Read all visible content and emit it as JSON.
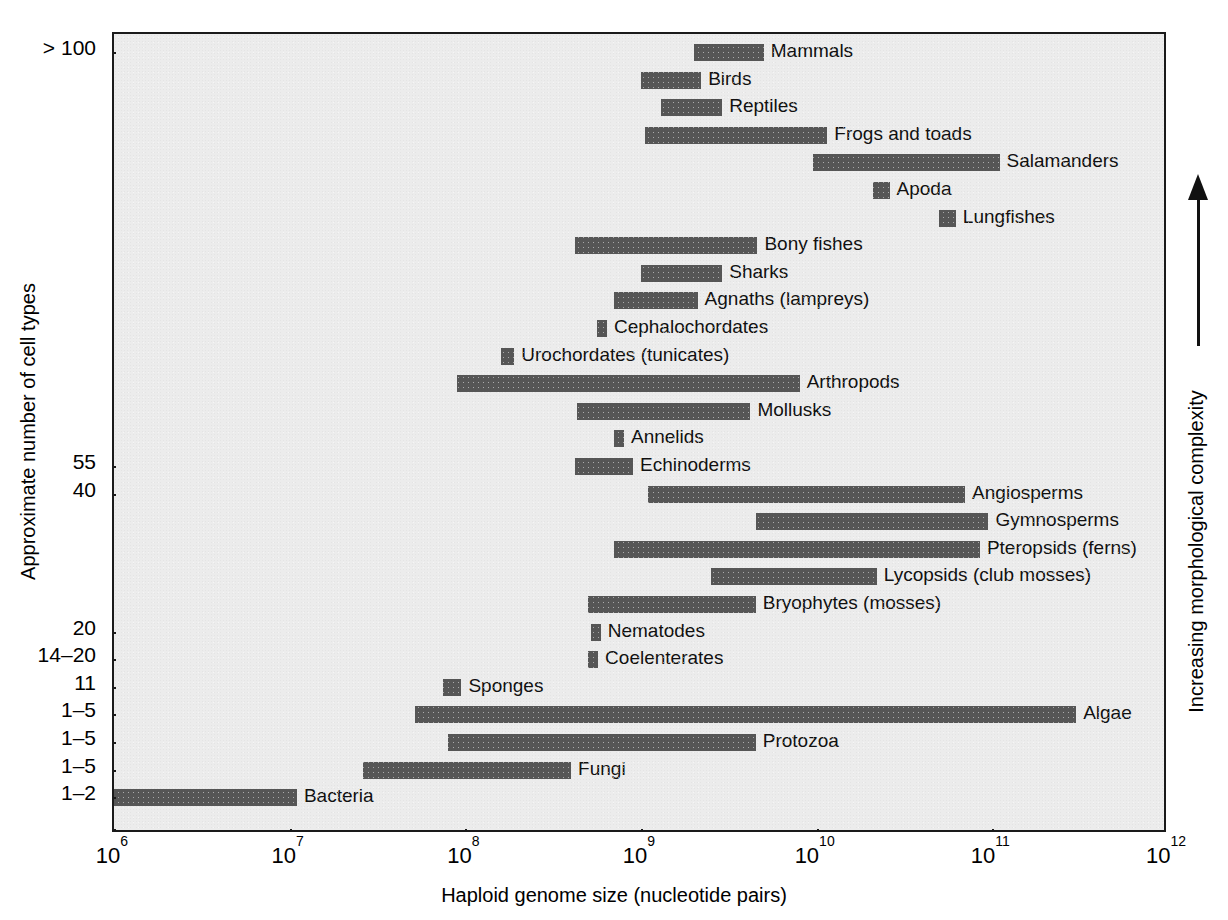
{
  "chart_data": {
    "type": "bar",
    "title": "",
    "xlabel": "Haploid genome size (nucleotide pairs)",
    "ylabel": "Approximate number of cell types",
    "right_axis_label": "Increasing morphological complexity",
    "xscale": "log",
    "xlim": [
      1000000,
      1000000000000
    ],
    "xticks": [
      "10⁶",
      "10⁷",
      "10⁸",
      "10⁹",
      "10¹⁰",
      "10¹¹",
      "10¹²"
    ],
    "xtick_mantissa": [
      "10",
      "10",
      "10",
      "10",
      "10",
      "10",
      "10"
    ],
    "xtick_exponent": [
      "6",
      "7",
      "8",
      "9",
      "10",
      "11",
      "12"
    ],
    "grid": false,
    "legend": "none",
    "bar_color": "#565656",
    "plot_background": "#ececec",
    "frame_color": "#1a1a1a",
    "ytick_labels": [
      {
        "label": "> 100",
        "row": 0
      },
      {
        "label": "55",
        "row": 15
      },
      {
        "label": "40",
        "row": 16
      },
      {
        "label": "20",
        "row": 21
      },
      {
        "label": "14–20",
        "row": 22
      },
      {
        "label": "11",
        "row": 23
      },
      {
        "label": "1–5",
        "row": 24
      },
      {
        "label": "1–5",
        "row": 25
      },
      {
        "label": "1–5",
        "row": 26
      },
      {
        "label": "1–2",
        "row": 27
      }
    ],
    "categories": [
      "Mammals",
      "Birds",
      "Reptiles",
      "Frogs and toads",
      "Salamanders",
      "Apoda",
      "Lungfishes",
      "Bony fishes",
      "Sharks",
      "Agnaths (lampreys)",
      "Cephalochordates",
      "Urochordates (tunicates)",
      "Arthropods",
      "Mollusks",
      "Annelids",
      "Echinoderms",
      "Angiosperms",
      "Gymnosperms",
      "Pteropsids (ferns)",
      "Lycopsids (club mosses)",
      "Bryophytes (mosses)",
      "Nematodes",
      "Coelenterates",
      "Sponges",
      "Algae",
      "Protozoa",
      "Fungi",
      "Bacteria"
    ],
    "ranges": [
      {
        "name": "Mammals",
        "min": 2000000000.0,
        "max": 5000000000.0,
        "label_side": "right"
      },
      {
        "name": "Birds",
        "min": 1000000000.0,
        "max": 2200000000.0,
        "label_side": "right"
      },
      {
        "name": "Reptiles",
        "min": 1300000000.0,
        "max": 2900000000.0,
        "label_side": "right"
      },
      {
        "name": "Frogs and toads",
        "min": 1050000000.0,
        "max": 11500000000.0,
        "label_side": "right"
      },
      {
        "name": "Salamanders",
        "min": 9500000000.0,
        "max": 110000000000.0,
        "label_side": "right"
      },
      {
        "name": "Apoda",
        "min": 21000000000.0,
        "max": 26000000000.0,
        "label_side": "right"
      },
      {
        "name": "Lungfishes",
        "min": 50000000000.0,
        "max": 62000000000.0,
        "label_side": "right"
      },
      {
        "name": "Bony fishes",
        "min": 420000000.0,
        "max": 4600000000.0,
        "label_side": "right"
      },
      {
        "name": "Sharks",
        "min": 1000000000.0,
        "max": 2900000000.0,
        "label_side": "right"
      },
      {
        "name": "Agnaths (lampreys)",
        "min": 700000000.0,
        "max": 2100000000.0,
        "label_side": "right"
      },
      {
        "name": "Cephalochordates",
        "min": 560000000.0,
        "max": 640000000.0,
        "label_side": "right"
      },
      {
        "name": "Urochordates (tunicates)",
        "min": 160000000.0,
        "max": 190000000.0,
        "label_side": "right"
      },
      {
        "name": "Arthropods",
        "min": 90000000.0,
        "max": 8000000000.0,
        "label_side": "right"
      },
      {
        "name": "Mollusks",
        "min": 430000000.0,
        "max": 4200000000.0,
        "label_side": "right"
      },
      {
        "name": "Annelids",
        "min": 700000000.0,
        "max": 800000000.0,
        "label_side": "right"
      },
      {
        "name": "Echinoderms",
        "min": 420000000.0,
        "max": 900000000.0,
        "label_side": "right"
      },
      {
        "name": "Angiosperms",
        "min": 1100000000.0,
        "max": 70000000000.0,
        "label_side": "right"
      },
      {
        "name": "Gymnosperms",
        "min": 4500000000.0,
        "max": 95000000000.0,
        "label_side": "right"
      },
      {
        "name": "Pteropsids (ferns)",
        "min": 700000000.0,
        "max": 85000000000.0,
        "label_side": "right"
      },
      {
        "name": "Lycopsids (club mosses)",
        "min": 2500000000.0,
        "max": 22000000000.0,
        "label_side": "right"
      },
      {
        "name": "Bryophytes (mosses)",
        "min": 500000000.0,
        "max": 4500000000.0,
        "label_side": "right"
      },
      {
        "name": "Nematodes",
        "min": 520000000.0,
        "max": 590000000.0,
        "label_side": "right"
      },
      {
        "name": "Coelenterates",
        "min": 500000000.0,
        "max": 570000000.0,
        "label_side": "right"
      },
      {
        "name": "Sponges",
        "min": 75000000.0,
        "max": 95000000.0,
        "label_side": "right"
      },
      {
        "name": "Algae",
        "min": 52000000.0,
        "max": 300000000000.0,
        "label_side": "right"
      },
      {
        "name": "Protozoa",
        "min": 80000000.0,
        "max": 4500000000.0,
        "label_side": "right"
      },
      {
        "name": "Fungi",
        "min": 26000000.0,
        "max": 400000000.0,
        "label_side": "right"
      },
      {
        "name": "Bacteria",
        "min": 620000.0,
        "max": 11000000.0,
        "label_side": "right"
      }
    ]
  }
}
